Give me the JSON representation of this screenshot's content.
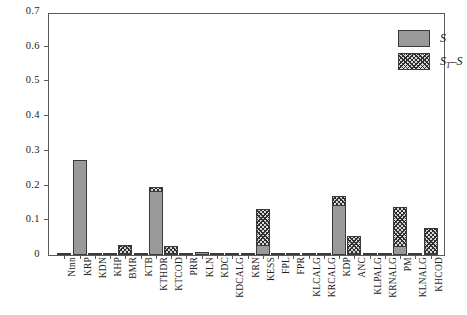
{
  "chart_data": {
    "type": "bar",
    "title": "",
    "subtitle": "",
    "xlabel": "",
    "ylabel": "",
    "stacked": true,
    "grid": false,
    "ylim": [
      0,
      0.7
    ],
    "ytick_labels": [
      "0",
      "0.1",
      "0.2",
      "0.3",
      "0.4",
      "0.5",
      "0.6",
      "0.7"
    ],
    "ytick_values": [
      0,
      0.1,
      0.2,
      0.3,
      0.4,
      0.5,
      0.6,
      0.7
    ],
    "legend_position": "top-right",
    "categories": [
      "Ntnn",
      "KRP",
      "KDN",
      "KHP",
      "BMR",
      "KTB",
      "KTHDR",
      "KTCOD",
      "PRR",
      "KLN",
      "KDC",
      "KDCALG",
      "KRN",
      "KESS",
      "FPL",
      "FPR",
      "KLCALG",
      "KRCALG",
      "KDP",
      "ANC",
      "KLPALG",
      "KRNALG",
      "PM",
      "KLNALG",
      "KHCOD"
    ],
    "series": [
      {
        "name": "S",
        "label": "S",
        "color": "#9a9a9a",
        "pattern": "solid",
        "values": [
          0.002,
          0.275,
          0.002,
          0.002,
          0.003,
          0.002,
          0.185,
          0.004,
          0.002,
          0.008,
          0.002,
          0.002,
          0.002,
          0.03,
          0.002,
          0.002,
          0.002,
          0.002,
          0.145,
          0.003,
          0.002,
          0.003,
          0.025,
          0.003,
          0.003
        ]
      },
      {
        "name": "ST-S",
        "label": "S_T - S",
        "color": "#d8d8d8",
        "pattern": "cross-hatch",
        "values": [
          0.0,
          0.0,
          0.0,
          0.0,
          0.025,
          0.0,
          0.013,
          0.024,
          0.0,
          0.0,
          0.0,
          0.0,
          0.0,
          0.105,
          0.0,
          0.0,
          0.0,
          0.0,
          0.027,
          0.052,
          0.0,
          0.0,
          0.115,
          0.0,
          0.075
        ]
      }
    ]
  },
  "legend": {
    "entries": [
      {
        "label": "S",
        "sub": "",
        "suffix": ""
      },
      {
        "label": "S",
        "sub": "T",
        "suffix": "–S"
      }
    ]
  }
}
